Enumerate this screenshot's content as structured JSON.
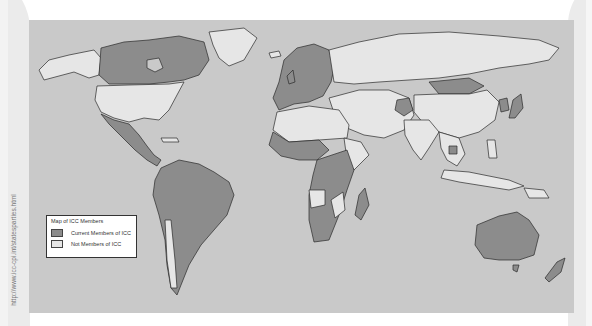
{
  "source_note": "http://www.icc-cpi.int/statesparties.html",
  "map": {
    "title": "Map of ICC Members",
    "colors": {
      "water": "#c9c9c9",
      "member": "#8c8c8c",
      "non_member": "#e6e6e6",
      "border": "#2a2a2a"
    },
    "legend": {
      "title": "Map of ICC Members",
      "items": [
        {
          "label": "Current Members of ICC",
          "color": "#8c8c8c"
        },
        {
          "label": "Not Members of ICC",
          "color": "#e6e6e6"
        }
      ]
    },
    "regions": {
      "members_shaded": [
        "Canada",
        "Mexico",
        "Central America",
        "South America",
        "Western Europe",
        "Mongolia",
        "Afghanistan",
        "Japan",
        "Korea (South)",
        "Sub-Saharan Africa (many)",
        "Madagascar",
        "Australia",
        "New Zealand",
        "Cambodia"
      ],
      "non_members_light": [
        "United States",
        "Alaska",
        "Greenland",
        "Russia",
        "China",
        "India",
        "Middle East",
        "North Africa",
        "Indonesia",
        "Southeast Asia (most)"
      ]
    }
  }
}
